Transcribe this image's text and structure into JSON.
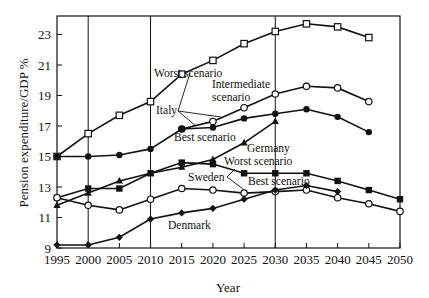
{
  "chart_data": {
    "type": "line",
    "title": "",
    "xlabel": "Year",
    "ylabel": "Pension expenditure/GDP %",
    "xlim": [
      1995,
      2050
    ],
    "ylim": [
      9,
      24
    ],
    "x_ticks": [
      1995,
      2000,
      2005,
      2010,
      2015,
      2020,
      2025,
      2030,
      2035,
      2040,
      2045,
      2050
    ],
    "y_ticks": [
      9,
      11,
      13,
      15,
      17,
      19,
      21,
      23
    ],
    "vertical_gridlines": [
      2000,
      2010,
      2030
    ],
    "legend": "none (inline annotations)",
    "series": [
      {
        "name": "Italy - Worst scenario",
        "marker": "open-square",
        "x": [
          1995,
          2000,
          2005,
          2010,
          2015,
          2020,
          2025,
          2030,
          2035,
          2040,
          2045
        ],
        "values": [
          15.0,
          16.5,
          17.7,
          18.6,
          20.4,
          21.3,
          22.4,
          23.2,
          23.7,
          23.5,
          22.8
        ]
      },
      {
        "name": "Italy - Intermediate scenario",
        "marker": "open-circle",
        "x": [
          2015,
          2020,
          2025,
          2030,
          2035,
          2040,
          2045
        ],
        "values": [
          16.8,
          17.3,
          18.2,
          19.1,
          19.6,
          19.5,
          18.6
        ]
      },
      {
        "name": "Italy - Best scenario",
        "marker": "filled-circle",
        "x": [
          1995,
          2000,
          2005,
          2010,
          2015,
          2020,
          2025,
          2030,
          2035,
          2040,
          2045
        ],
        "values": [
          15.0,
          15.0,
          15.1,
          15.5,
          16.8,
          16.9,
          17.5,
          17.8,
          18.1,
          17.6,
          16.6
        ]
      },
      {
        "name": "Germany",
        "marker": "filled-triangle",
        "x": [
          1995,
          2000,
          2005,
          2010,
          2015,
          2020,
          2025,
          2030
        ],
        "values": [
          11.8,
          12.6,
          13.4,
          13.9,
          14.3,
          14.8,
          15.9,
          17.3
        ]
      },
      {
        "name": "Sweden - Worst scenario",
        "marker": "filled-square",
        "x": [
          1995,
          2000,
          2005,
          2010,
          2015,
          2020,
          2025,
          2030,
          2035,
          2040,
          2045,
          2050
        ],
        "values": [
          12.3,
          12.9,
          12.9,
          13.9,
          14.6,
          14.5,
          13.9,
          13.9,
          13.9,
          13.4,
          12.8,
          12.2
        ]
      },
      {
        "name": "Sweden - Best scenario",
        "marker": "open-circle",
        "x": [
          1995,
          2000,
          2005,
          2010,
          2015,
          2020,
          2025,
          2030,
          2035,
          2040,
          2045,
          2050
        ],
        "values": [
          12.3,
          11.8,
          11.5,
          12.2,
          12.9,
          12.8,
          12.6,
          12.7,
          12.8,
          12.3,
          11.9,
          11.4
        ]
      },
      {
        "name": "Denmark",
        "marker": "filled-diamond",
        "x": [
          1995,
          2000,
          2005,
          2010,
          2015,
          2020,
          2025,
          2030,
          2035,
          2040
        ],
        "values": [
          9.2,
          9.2,
          9.7,
          10.9,
          11.3,
          11.6,
          12.2,
          12.8,
          13.1,
          12.7
        ]
      }
    ],
    "annotations": [
      {
        "text": "Worst scenario",
        "x": 154,
        "y": 77
      },
      {
        "text": "Intermediate",
        "x": 212,
        "y": 88
      },
      {
        "text": "scenario",
        "x": 212,
        "y": 101
      },
      {
        "text": "Italy",
        "x": 156,
        "y": 114
      },
      {
        "text": "Best scenario",
        "x": 174,
        "y": 141
      },
      {
        "text": "Germany",
        "x": 247,
        "y": 152
      },
      {
        "text": "Worst scenario",
        "x": 224,
        "y": 165
      },
      {
        "text": "Sweden",
        "x": 188,
        "y": 181
      },
      {
        "text": "Best scenario",
        "x": 248,
        "y": 185
      },
      {
        "text": "Denmark",
        "x": 168,
        "y": 229
      }
    ]
  },
  "layout": {
    "plot": {
      "left": 57,
      "right": 400,
      "top": 16,
      "bottom": 248
    },
    "colors": {
      "ink": "#111111",
      "background": "#ffffff"
    }
  }
}
